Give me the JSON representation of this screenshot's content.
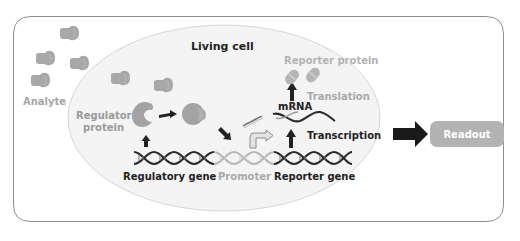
{
  "diagram": {
    "title": "Living cell",
    "colors": {
      "frame_border": "#8a8a8a",
      "cell_fill": "#f4f4f4",
      "cell_border": "#d9d9d9",
      "dark": "#222222",
      "gray_text": "#9e9e9e",
      "gray_shape": "#a8a8a8",
      "readout_fill": "#b3b3b3",
      "readout_text": "#ffffff"
    },
    "labels": {
      "analyte": "Analyte",
      "regulator_protein_line1": "Regulator",
      "regulator_protein_line2": "protein",
      "regulatory_gene": "Regulatory gene",
      "promoter": "Promoter",
      "reporter_gene": "Reporter gene",
      "mrna": "mRNA",
      "transcription": "Transcription",
      "translation": "Translation",
      "reporter_protein": "Reporter protein",
      "readout": "Readout"
    },
    "nodes": [
      {
        "id": "analyte",
        "label": "Analyte",
        "shape": "molecule",
        "count_outside_cell": 4,
        "count_inside_cell": 2
      },
      {
        "id": "regulator-protein",
        "label": "Regulator protein",
        "shape": "c-shape"
      },
      {
        "id": "regulator-bound",
        "shape": "bound-complex"
      },
      {
        "id": "regulatory-gene",
        "label": "Regulatory gene",
        "shape": "dna-segment"
      },
      {
        "id": "promoter",
        "label": "Promoter",
        "shape": "dna-segment"
      },
      {
        "id": "reporter-gene",
        "label": "Reporter gene",
        "shape": "dna-segment"
      },
      {
        "id": "mrna",
        "label": "mRNA",
        "shape": "wavy-strand"
      },
      {
        "id": "reporter-protein",
        "label": "Reporter protein",
        "shape": "capsule",
        "count": 2
      },
      {
        "id": "readout",
        "label": "Readout",
        "shape": "rounded-box"
      }
    ],
    "edges": [
      {
        "from": "regulatory-gene",
        "to": "regulator-protein"
      },
      {
        "from": "regulator-protein",
        "to": "regulator-bound"
      },
      {
        "from": "regulator-bound",
        "to": "promoter"
      },
      {
        "from": "reporter-gene",
        "to": "mrna",
        "label": "Transcription"
      },
      {
        "from": "mrna",
        "to": "reporter-protein",
        "label": "Translation"
      },
      {
        "from": "living-cell",
        "to": "readout"
      }
    ]
  }
}
